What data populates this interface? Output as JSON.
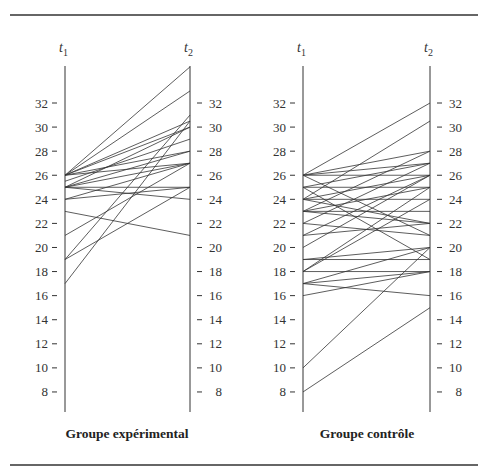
{
  "figure": {
    "top_rule": true,
    "bottom_rule": true,
    "line_color": "#333333"
  },
  "chart_data": [
    {
      "type": "line",
      "subtype": "paired-slope",
      "title": "Groupe expérimental",
      "xlabel": "",
      "ylabel": "",
      "axes": [
        {
          "name": "t1",
          "label": "t",
          "subscript": "1"
        },
        {
          "name": "t2",
          "label": "t",
          "subscript": "2"
        }
      ],
      "y_ticks": [
        8,
        10,
        12,
        14,
        16,
        18,
        20,
        22,
        24,
        26,
        28,
        30,
        32
      ],
      "ylim": [
        6.5,
        35.5
      ],
      "grid": false,
      "pairs": [
        {
          "t1": 26,
          "t2": 35
        },
        {
          "t1": 26,
          "t2": 33
        },
        {
          "t1": 26,
          "t2": 30.5
        },
        {
          "t1": 26,
          "t2": 30
        },
        {
          "t1": 26,
          "t2": 28
        },
        {
          "t1": 26,
          "t2": 27
        },
        {
          "t1": 25.5,
          "t2": 29
        },
        {
          "t1": 25,
          "t2": 30
        },
        {
          "t1": 25,
          "t2": 28
        },
        {
          "t1": 25,
          "t2": 27
        },
        {
          "t1": 25,
          "t2": 25
        },
        {
          "t1": 25,
          "t2": 24
        },
        {
          "t1": 24,
          "t2": 27
        },
        {
          "t1": 24,
          "t2": 25
        },
        {
          "t1": 23,
          "t2": 21
        },
        {
          "t1": 21,
          "t2": 27
        },
        {
          "t1": 19,
          "t2": 31
        },
        {
          "t1": 19,
          "t2": 25
        },
        {
          "t1": 17,
          "t2": 30.5
        }
      ]
    },
    {
      "type": "line",
      "subtype": "paired-slope",
      "title": "Groupe contrôle",
      "xlabel": "",
      "ylabel": "",
      "axes": [
        {
          "name": "t1",
          "label": "t",
          "subscript": "1"
        },
        {
          "name": "t2",
          "label": "t",
          "subscript": "2"
        }
      ],
      "y_ticks": [
        8,
        10,
        12,
        14,
        16,
        18,
        20,
        22,
        24,
        26,
        28,
        30,
        32
      ],
      "ylim": [
        6.5,
        35.5
      ],
      "grid": false,
      "pairs": [
        {
          "t1": 26,
          "t2": 32
        },
        {
          "t1": 26,
          "t2": 28
        },
        {
          "t1": 26,
          "t2": 27
        },
        {
          "t1": 26,
          "t2": 26
        },
        {
          "t1": 26,
          "t2": 21
        },
        {
          "t1": 25,
          "t2": 27
        },
        {
          "t1": 25,
          "t2": 25
        },
        {
          "t1": 25,
          "t2": 19
        },
        {
          "t1": 24,
          "t2": 30.5
        },
        {
          "t1": 24,
          "t2": 26
        },
        {
          "t1": 24,
          "t2": 24
        },
        {
          "t1": 24,
          "t2": 22
        },
        {
          "t1": 23,
          "t2": 28
        },
        {
          "t1": 23,
          "t2": 25
        },
        {
          "t1": 23,
          "t2": 23
        },
        {
          "t1": 23,
          "t2": 22
        },
        {
          "t1": 22,
          "t2": 27
        },
        {
          "t1": 22,
          "t2": 21
        },
        {
          "t1": 21,
          "t2": 26
        },
        {
          "t1": 21,
          "t2": 22
        },
        {
          "t1": 20,
          "t2": 26
        },
        {
          "t1": 19,
          "t2": 20
        },
        {
          "t1": 19,
          "t2": 19
        },
        {
          "t1": 18,
          "t2": 25
        },
        {
          "t1": 18,
          "t2": 24
        },
        {
          "t1": 18,
          "t2": 18
        },
        {
          "t1": 17,
          "t2": 20
        },
        {
          "t1": 17,
          "t2": 18
        },
        {
          "t1": 17,
          "t2": 16
        },
        {
          "t1": 16,
          "t2": 18
        },
        {
          "t1": 10,
          "t2": 20
        },
        {
          "t1": 8,
          "t2": 15
        }
      ]
    }
  ]
}
